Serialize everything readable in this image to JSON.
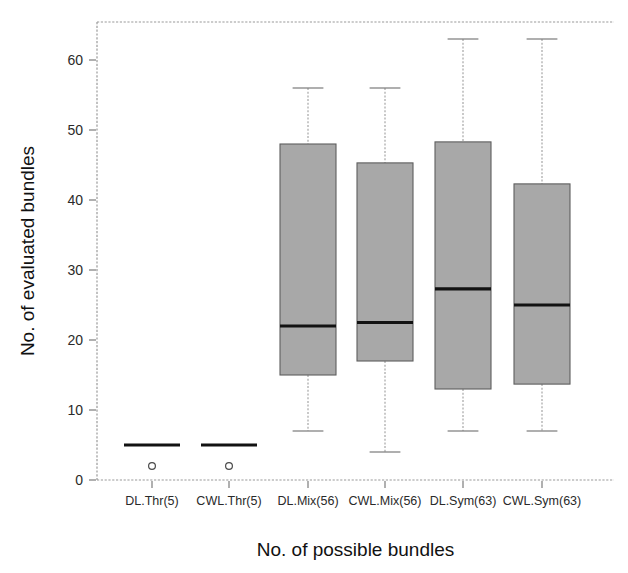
{
  "chart_data": {
    "type": "box",
    "title": "",
    "xlabel": "No. of possible bundles",
    "ylabel": "No. of evaluated bundles",
    "categories": [
      "DL.Thr(5)",
      "CWL.Thr(5)",
      "DL.Mix(56)",
      "CWL.Mix(56)",
      "DL.Sym(63)",
      "CWL.Sym(63)"
    ],
    "ylim": [
      0,
      65.5
    ],
    "yticks": [
      0,
      10,
      20,
      30,
      40,
      50,
      60
    ],
    "ytick_labels": [
      "0",
      "10",
      "20",
      "30",
      "40",
      "50",
      "60"
    ],
    "grid": false,
    "legend": "none",
    "box_fill_color": "#a8a8a8",
    "median_color": "#121212",
    "boxes": [
      {
        "category": "DL.Thr(5)",
        "whisker_low": 5,
        "q1": 5,
        "median": 5,
        "q3": 5,
        "whisker_high": 5,
        "outliers": [
          2
        ]
      },
      {
        "category": "CWL.Thr(5)",
        "whisker_low": 5,
        "q1": 5,
        "median": 5,
        "q3": 5,
        "whisker_high": 5,
        "outliers": [
          2
        ]
      },
      {
        "category": "DL.Mix(56)",
        "whisker_low": 7,
        "q1": 15,
        "median": 22,
        "q3": 48,
        "whisker_high": 56,
        "outliers": []
      },
      {
        "category": "CWL.Mix(56)",
        "whisker_low": 4,
        "q1": 17,
        "median": 22.5,
        "q3": 45.3,
        "whisker_high": 56,
        "outliers": []
      },
      {
        "category": "DL.Sym(63)",
        "whisker_low": 7,
        "q1": 13,
        "median": 27.3,
        "q3": 48.3,
        "whisker_high": 63,
        "outliers": []
      },
      {
        "category": "CWL.Sym(63)",
        "whisker_low": 7,
        "q1": 13.7,
        "median": 25,
        "q3": 42.3,
        "whisker_high": 63,
        "outliers": []
      }
    ]
  }
}
